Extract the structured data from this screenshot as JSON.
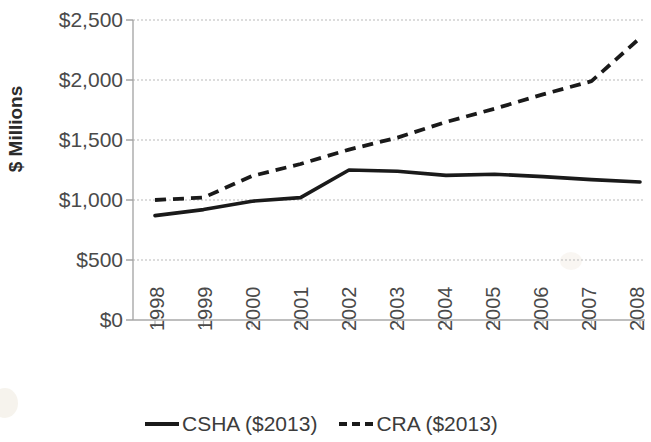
{
  "chart_data": {
    "type": "line",
    "title": "",
    "xlabel": "",
    "ylabel": "$ Millions",
    "categories": [
      "1998",
      "1999",
      "2000",
      "2001",
      "2002",
      "2003",
      "2004",
      "2005",
      "2006",
      "2007",
      "2008"
    ],
    "ylim": [
      0,
      2500
    ],
    "ytick_values": [
      0,
      500,
      1000,
      1500,
      2000,
      2500
    ],
    "ytick_labels": [
      "$0",
      "$500",
      "$1,000",
      "$1,500",
      "$2,000",
      "$2,500"
    ],
    "grid": true,
    "grid_axis": "y",
    "legend_position": "bottom",
    "series": [
      {
        "name": "CSHA ($2013)",
        "style": "solid",
        "color": "#1a1a1a",
        "values": [
          870,
          920,
          990,
          1020,
          1250,
          1240,
          1205,
          1215,
          1195,
          1170,
          1150
        ]
      },
      {
        "name": "CRA  ($2013)",
        "style": "dashed",
        "color": "#1a1a1a",
        "values": [
          1000,
          1020,
          1200,
          1300,
          1420,
          1520,
          1650,
          1760,
          1880,
          1990,
          2350
        ]
      }
    ]
  },
  "axis": {
    "y_title": "$ Millions"
  },
  "legend": {
    "items": [
      {
        "label": "CSHA ($2013)",
        "style": "solid"
      },
      {
        "label": "CRA  ($2013)",
        "style": "dashed"
      }
    ]
  }
}
